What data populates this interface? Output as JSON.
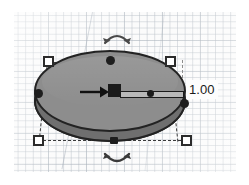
{
  "app": {
    "name": "3d-design-editor",
    "view": "perspective-workplane"
  },
  "workplane": {
    "name": "workplane",
    "grid_visible": true,
    "grid_major_color": "#b9c0c8",
    "grid_minor_color": "#a0aab4",
    "background_color": "#fbfbfb"
  },
  "shape": {
    "name": "cylinder",
    "selected": true,
    "top_face_color": "#8d8d8d",
    "side_color": "#5a5a5a",
    "skirt_color": "#6f6f6f",
    "outline_color": "#232323"
  },
  "selection": {
    "bounding_box_visible": true,
    "bounding_box_style": "dashed",
    "bounding_box_color": "#3a3a3a",
    "corner_handles": [
      {
        "id": "top-left",
        "label": "scale-handle-top-left"
      },
      {
        "id": "top-right",
        "label": "scale-handle-top-right"
      },
      {
        "id": "bottom-left",
        "label": "scale-handle-bottom-left"
      },
      {
        "id": "bottom-right",
        "label": "scale-handle-bottom-right"
      }
    ],
    "edge_handles": [
      {
        "id": "top",
        "label": "edge-handle-top"
      },
      {
        "id": "left",
        "label": "edge-handle-left"
      },
      {
        "id": "right",
        "label": "edge-handle-right"
      },
      {
        "id": "bottom",
        "label": "edge-handle-bottom"
      }
    ]
  },
  "rotation": {
    "top_arrow_icon": "rotate-arrow-icon",
    "bottom_arrow_icon": "rotate-arrow-icon",
    "arrow_color": "#4a4a4a"
  },
  "gizmo": {
    "direction_arrow_icon": "arrow-right-icon",
    "direction_arrow_color": "#111111",
    "slider": {
      "name": "dimension-slider",
      "handle_icon": "square-handle-icon",
      "track_color": "#b9b9b9",
      "knob_position_percent": 55
    }
  },
  "value_tooltip": {
    "name": "dimension-value",
    "text": "1.00",
    "background": "#fdfdfd",
    "text_color": "#1a1a1a"
  }
}
